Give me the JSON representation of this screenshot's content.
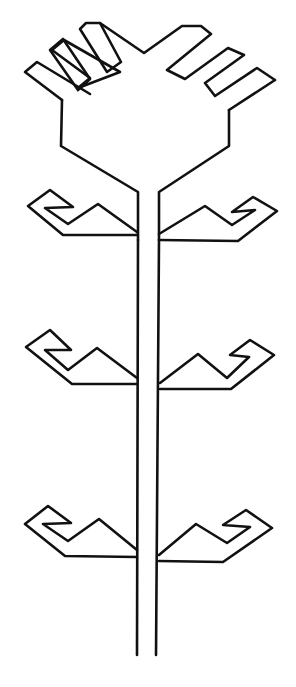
{
  "figure": {
    "colors": {
      "line": "#111111",
      "background": "#ffffff"
    },
    "parts": {
      "crown_fingers": 6,
      "branch_pairs": 3,
      "stem": "double-line trunk"
    }
  }
}
